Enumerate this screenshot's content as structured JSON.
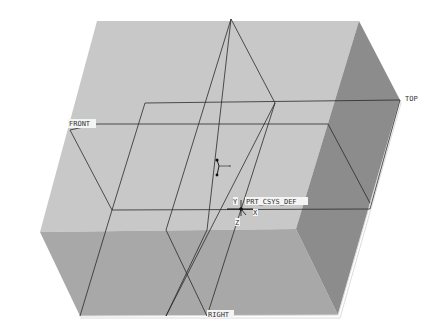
{
  "viewport": {
    "background": "#ffffff",
    "model": {
      "faces": {
        "top_color": "#c9c9c9",
        "front_color": "#a9a9a9",
        "right_color": "#8e8e8e",
        "edge_color": "#dcdcdc"
      }
    },
    "datum_planes": [
      {
        "name": "FRONT",
        "label": "FRONT"
      },
      {
        "name": "TOP",
        "label": "TOP"
      },
      {
        "name": "RIGHT",
        "label": "RIGHT"
      }
    ],
    "csys": {
      "label": "PRT_CSYS_DEF",
      "axis_x": "X",
      "axis_y": "Y",
      "axis_z": "Z"
    },
    "line_color": "#2a2a2a"
  }
}
